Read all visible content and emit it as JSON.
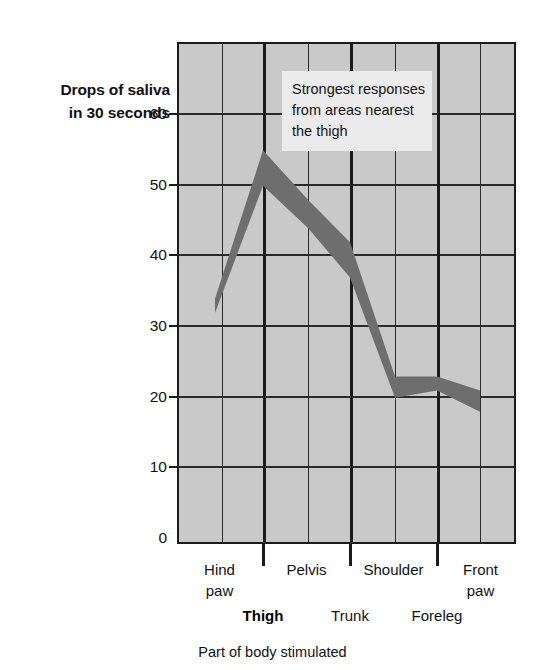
{
  "chart_data": {
    "type": "line",
    "title": "",
    "subtitle": "",
    "ylabel_line1": "Drops of saliva",
    "ylabel_line2": "in 30 seconds",
    "xlabel": "Part of body stimulated",
    "ylim": [
      0,
      65
    ],
    "yticks": [
      0,
      10,
      20,
      30,
      40,
      50,
      60
    ],
    "ytick_labels": [
      "0",
      "10",
      "20",
      "30",
      "40",
      "50",
      "60"
    ],
    "grid": true,
    "legend": "none",
    "x_categories_primary": [
      "Hind paw",
      "Pelvis",
      "Shoulder",
      "Front paw"
    ],
    "x_categories_secondary": [
      "Thigh",
      "Trunk",
      "Foreleg"
    ],
    "x_labels_row1": [
      {
        "line1": "Hind",
        "line2": "paw"
      },
      {
        "line1": "Pelvis",
        "line2": ""
      },
      {
        "line1": "Shoulder",
        "line2": ""
      },
      {
        "line1": "Front",
        "line2": "paw"
      }
    ],
    "x_labels_row2": [
      {
        "label": "Thigh",
        "bold": true
      },
      {
        "label": "Trunk",
        "bold": false
      },
      {
        "label": "Foreleg",
        "bold": false
      }
    ],
    "x": [
      "Hind paw",
      "Thigh",
      "Pelvis",
      "Trunk",
      "Shoulder",
      "Foreleg",
      "Front paw"
    ],
    "values": [
      33,
      54,
      46,
      40,
      22,
      22,
      19
    ],
    "band": {
      "description": "thick shaded band representing response range",
      "upper": [
        34,
        55,
        48,
        42,
        23,
        23,
        21
      ],
      "lower": [
        32,
        50,
        44,
        37,
        20,
        21,
        18
      ],
      "color": "#6e6e6e"
    },
    "annotation": {
      "line1": "Strongest responses",
      "line2": "from areas nearest",
      "line3": "the thigh"
    },
    "colors": {
      "plot_background": "#c9c9c9",
      "grid": "#2a2a2a",
      "axis": "#1b1b1b",
      "band": "#6e6e6e",
      "annotation_background": "#ebebeb",
      "text": "#111111"
    }
  }
}
